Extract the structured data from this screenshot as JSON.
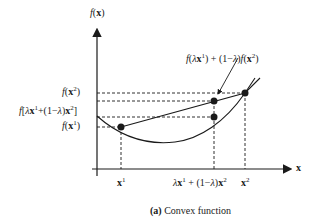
{
  "figure": {
    "caption_tag": "(a)",
    "caption_text": "Convex function",
    "y_axis_label": "f(x)",
    "x_axis_label": "x",
    "annotation": "f(λx¹) + (1−λ)f(x²)",
    "y_tick_labels": [
      {
        "id": "f_x2",
        "text": "f(x²)"
      },
      {
        "id": "f_comb",
        "text": "f[λx¹+(1−λ)x²]"
      },
      {
        "id": "f_x1",
        "text": "f(x¹)"
      }
    ],
    "x_tick_labels": [
      {
        "id": "x1",
        "text": "x¹"
      },
      {
        "id": "comb",
        "text": "λx¹ + (1−λ)x²"
      },
      {
        "id": "x2",
        "text": "x²"
      }
    ],
    "colors": {
      "ink": "#1a1a1a",
      "background": "#ffffff"
    }
  }
}
